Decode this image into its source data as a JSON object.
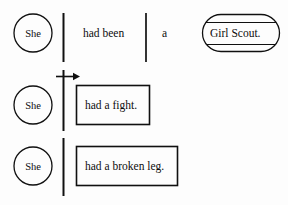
{
  "figure": {
    "background_color": "#fdfdfd",
    "ink_color": "#101010"
  },
  "rows": [
    {
      "id": "row-1",
      "subject": "She",
      "predicate": "had been",
      "article": "a",
      "complement": "Girl Scout."
    },
    {
      "id": "row-2",
      "subject": "She",
      "predicate": "had a fight."
    },
    {
      "id": "row-3",
      "subject": "She",
      "predicate": "had a broken leg."
    }
  ],
  "annotations": {
    "arrow_label": ""
  }
}
